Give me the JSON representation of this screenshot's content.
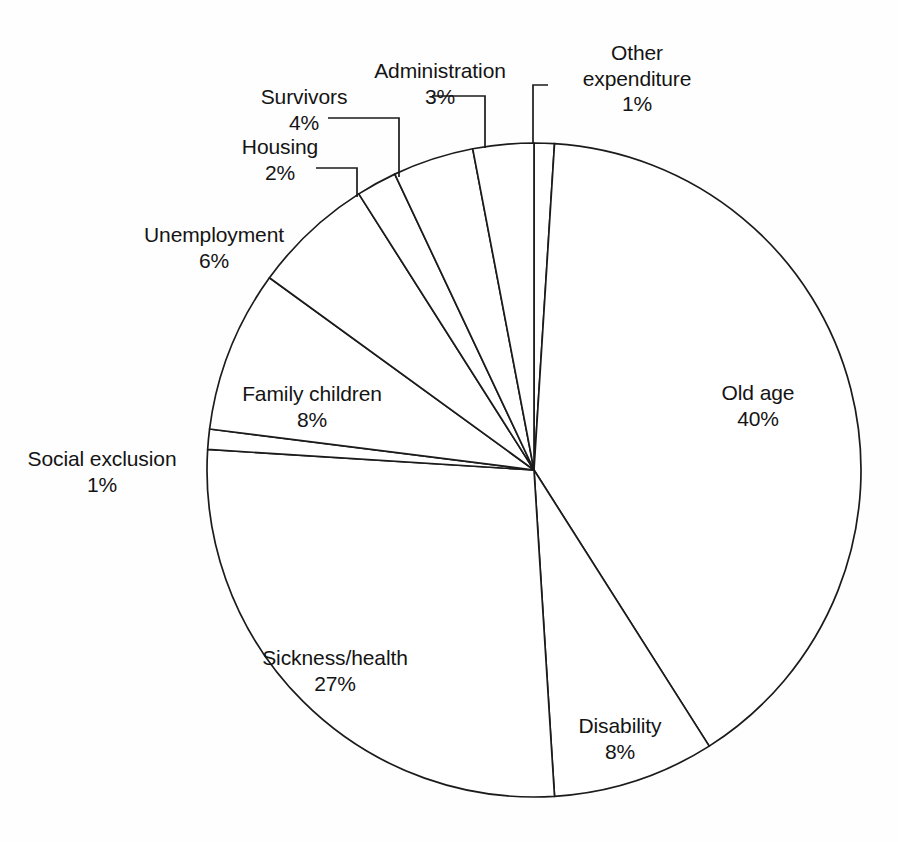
{
  "chart_data": {
    "type": "pie",
    "title": "",
    "subtitle": "",
    "xlabel": "",
    "ylabel": "",
    "legend_position": "none",
    "grid": false,
    "units": "percent",
    "start_angle_deg": 0,
    "direction": "clockwise",
    "total": 100,
    "categories": [
      "Other expenditure",
      "Old age",
      "Disability",
      "Sickness/health",
      "Social exclusion",
      "Family children",
      "Unemployment",
      "Housing",
      "Survivors",
      "Administration"
    ],
    "values": [
      1,
      40,
      8,
      27,
      1,
      8,
      6,
      2,
      4,
      3
    ],
    "slices": [
      {
        "label": "Other expenditure",
        "value": 1,
        "percent_text": "1%",
        "start_deg": 0.0,
        "end_deg": 3.6
      },
      {
        "label": "Old age",
        "value": 40,
        "percent_text": "40%",
        "start_deg": 3.6,
        "end_deg": 147.6
      },
      {
        "label": "Disability",
        "value": 8,
        "percent_text": "8%",
        "start_deg": 147.6,
        "end_deg": 176.4
      },
      {
        "label": "Sickness/health",
        "value": 27,
        "percent_text": "27%",
        "start_deg": 176.4,
        "end_deg": 273.6
      },
      {
        "label": "Social exclusion",
        "value": 1,
        "percent_text": "1%",
        "start_deg": 273.6,
        "end_deg": 277.2
      },
      {
        "label": "Family children",
        "value": 8,
        "percent_text": "8%",
        "start_deg": 277.2,
        "end_deg": 306.0
      },
      {
        "label": "Unemployment",
        "value": 6,
        "percent_text": "6%",
        "start_deg": 306.0,
        "end_deg": 327.6
      },
      {
        "label": "Housing",
        "value": 2,
        "percent_text": "2%",
        "start_deg": 327.6,
        "end_deg": 334.8
      },
      {
        "label": "Survivors",
        "value": 4,
        "percent_text": "4%",
        "start_deg": 334.8,
        "end_deg": 349.2
      },
      {
        "label": "Administration",
        "value": 3,
        "percent_text": "3%",
        "start_deg": 349.2,
        "end_deg": 360.0
      }
    ],
    "colors": {
      "slice_fill": "#ffffff",
      "slice_stroke": "#1b1b1b",
      "label_text": "#141414",
      "background": "#fefefe"
    }
  },
  "labels": {
    "other_expenditure": {
      "name": "Other expenditure",
      "name_line1": "Other",
      "name_line2": "expenditure",
      "pct": "1%"
    },
    "administration": {
      "name": "Administration",
      "pct": "3%"
    },
    "survivors": {
      "name": "Survivors",
      "pct": "4%"
    },
    "housing": {
      "name": "Housing",
      "pct": "2%"
    },
    "unemployment": {
      "name": "Unemployment",
      "pct": "6%"
    },
    "family_children": {
      "name": "Family children",
      "pct": "8%"
    },
    "social_exclusion": {
      "name": "Social exclusion",
      "pct": "1%"
    },
    "sickness_health": {
      "name": "Sickness/health",
      "pct": "27%"
    },
    "disability": {
      "name": "Disability",
      "pct": "8%"
    },
    "old_age": {
      "name": "Old age",
      "pct": "40%"
    }
  }
}
